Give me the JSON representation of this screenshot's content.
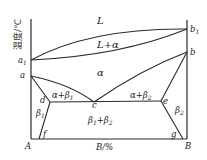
{
  "diagram": {
    "type": "binary-phase-diagram",
    "y_axis_label": "温度/℃",
    "x_axis_label": "B/%",
    "components": {
      "left": "A",
      "right": "B"
    },
    "points": {
      "a1": "a1",
      "a": "a",
      "b1": "b1",
      "b": "b",
      "c": "c",
      "d": "d",
      "e": "e",
      "f": "f",
      "g": "g"
    },
    "regions": {
      "liquid": "L",
      "liquid_alpha": "L+α",
      "alpha": "α",
      "alpha_beta1": "α+β1",
      "alpha_beta2": "α+β2",
      "beta1": "β1",
      "beta2": "β2",
      "beta1_beta2": "β1+β2"
    },
    "colors": {
      "line": "#2a2a2a",
      "background": "#ffffff"
    }
  }
}
